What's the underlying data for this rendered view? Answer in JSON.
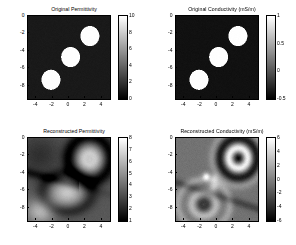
{
  "figure": {
    "background": "#ffffff",
    "colormap": "gray",
    "layout": "2x2 subplot grid"
  },
  "chart_data": [
    {
      "type": "heatmap",
      "panel": "top-left",
      "title": "Original Permittivity",
      "xlabel": "",
      "ylabel": "",
      "xlim": [
        -5,
        5
      ],
      "ylim": [
        -9.5,
        0
      ],
      "xticks": [
        -4,
        -2,
        0,
        2,
        4
      ],
      "yticks": [
        0,
        -2,
        -4,
        -6,
        -8
      ],
      "grid": false,
      "colorbar": {
        "min": 0,
        "max": 10,
        "ticks": [
          10,
          8,
          6,
          4,
          2,
          0
        ],
        "position": "right"
      },
      "background_value": 1,
      "inclusions": [
        {
          "cx": 2.55,
          "cy": -2.3,
          "r": 1.15,
          "value": 10
        },
        {
          "cx": 0.2,
          "cy": -4.7,
          "r": 1.15,
          "value": 10
        },
        {
          "cx": -2.2,
          "cy": -7.3,
          "r": 1.15,
          "value": 10
        }
      ]
    },
    {
      "type": "heatmap",
      "panel": "top-right",
      "title": "Original Conductivity (mS/m)",
      "xlabel": "",
      "ylabel": "",
      "xlim": [
        -5,
        5
      ],
      "ylim": [
        -9.5,
        0
      ],
      "xticks": [
        -4,
        -2,
        0,
        2,
        4
      ],
      "yticks": [
        0,
        -2,
        -4,
        -6,
        -8
      ],
      "grid": false,
      "colorbar": {
        "min": -0.5,
        "max": 1,
        "ticks": [
          1,
          0.5,
          0,
          -0.5
        ],
        "position": "right"
      },
      "background_value": -0.4,
      "inclusions": [
        {
          "cx": 2.55,
          "cy": -2.3,
          "r": 1.15,
          "value": 1
        },
        {
          "cx": 0.2,
          "cy": -4.7,
          "r": 1.15,
          "value": 1
        },
        {
          "cx": -2.2,
          "cy": -7.3,
          "r": 1.15,
          "value": 1
        }
      ]
    },
    {
      "type": "heatmap",
      "panel": "bottom-left",
      "title": "Reconstructed Permittivity",
      "xlabel": "",
      "ylabel": "",
      "xlim": [
        -5,
        5
      ],
      "ylim": [
        -9.5,
        0
      ],
      "xticks": [
        -4,
        -2,
        0,
        2,
        4
      ],
      "yticks": [
        0,
        -2,
        -4,
        -6,
        -8
      ],
      "grid": false,
      "colorbar": {
        "min": 1,
        "max": 8,
        "ticks": [
          8,
          7,
          6,
          5,
          4,
          3,
          2,
          1
        ],
        "position": "right"
      },
      "background_value": 3.4,
      "features": [
        {
          "kind": "ring-blob",
          "cx": 2.5,
          "cy": -2.4,
          "r": 1.5,
          "peak": 7.5
        },
        {
          "kind": "blob",
          "cx": -0.2,
          "cy": -6.2,
          "r": 1.9,
          "peak": 6.4
        },
        {
          "kind": "blob",
          "cx": -3.4,
          "cy": -8.3,
          "r": 1.5,
          "peak": 5.8
        },
        {
          "kind": "dark-halo",
          "cx": 2.5,
          "cy": -2.4,
          "r": 2.6,
          "value": 1.4
        }
      ]
    },
    {
      "type": "heatmap",
      "panel": "bottom-right",
      "title": "Reconstructed Conductivity (mS/m)",
      "xlabel": "",
      "ylabel": "",
      "xlim": [
        -5,
        5
      ],
      "ylim": [
        -9.5,
        0
      ],
      "xticks": [
        -4,
        -2,
        0,
        2,
        4
      ],
      "yticks": [
        0,
        -2,
        -4,
        -6,
        -8
      ],
      "grid": false,
      "colorbar": {
        "min": -6,
        "max": 6,
        "ticks": [
          6,
          4,
          2,
          0,
          -2,
          -4,
          -6
        ],
        "position": "right"
      },
      "background_value": -0.6,
      "features": [
        {
          "kind": "bullseye",
          "cx": 2.6,
          "cy": -2.3,
          "r": 1.9,
          "peak": 5.5
        },
        {
          "kind": "blob",
          "cx": -1.3,
          "cy": -4.4,
          "r": 0.6,
          "peak": 5.0
        },
        {
          "kind": "blob",
          "cx": -0.4,
          "cy": -5.6,
          "r": 0.8,
          "peak": 3.6
        },
        {
          "kind": "arc",
          "cx": -1.6,
          "cy": -7.6,
          "r": 1.7,
          "peak": 3.2
        }
      ]
    }
  ]
}
